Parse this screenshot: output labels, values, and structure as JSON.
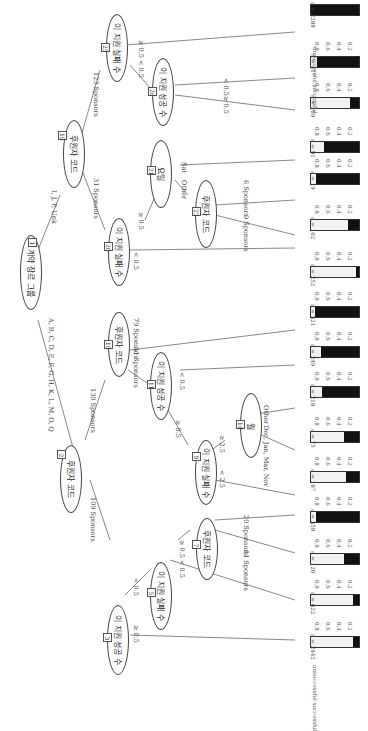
{
  "diagram": {
    "type": "decision-tree",
    "orientation": "rotated-90",
    "legend": {
      "labels": [
        "unsuccessful",
        "successful"
      ],
      "colors": {
        "successful": "#f2f2f2",
        "unsuccessful": "#111111"
      }
    },
    "axis_ticks": [
      "0.8",
      "0.6",
      "0.4",
      "0.2"
    ],
    "nodes": [
      {
        "id": "1",
        "label": "계약 장르 그룹"
      },
      {
        "id": "2",
        "label": "후원자 코드"
      },
      {
        "id": "3",
        "label": "이 지원 성공 수"
      },
      {
        "id": "5",
        "label": "이 지원 실패 수"
      },
      {
        "id": "7",
        "label": "후원자 코드"
      },
      {
        "id": "9",
        "label": "이 지원 실패 수"
      },
      {
        "id": "10",
        "label": "후원자 코드"
      },
      {
        "id": "11",
        "label": "이 지원 성공 수"
      },
      {
        "id": "14",
        "label": "월"
      },
      {
        "id": "19",
        "label": "후원자 코드"
      },
      {
        "id": "20",
        "label": "이 지원 실패 수"
      },
      {
        "id": "21",
        "label": "요일"
      },
      {
        "id": "23",
        "label": "후원자 코드"
      },
      {
        "id": "25",
        "label": "이 지원 실패 수"
      },
      {
        "id": "26",
        "label": "이 지원 성공 수"
      }
    ],
    "edges": {
      "e1_2": "A, B, C, D, E, F, G, H, K, L, M, O, Q",
      "e1_19": "I, J, P, Unk",
      "e2_3": "109 Sponsors",
      "e2_10": "130 Sponsors",
      "e3_leaf": "≥ 0.5",
      "e3_5": "< 0.5",
      "e5_leaf": "< 0.5",
      "e5_7": "≥ 0.5",
      "e7_l1": "11 Sponsors",
      "e7_l2": "20 Sponsors",
      "e10_11": "51 Sponsors",
      "e10_leaf": "79 Sponsors",
      "e11_9": "≥ 0.5",
      "e11_leaf": "< 0.5",
      "e9_leaf": "< 2.5",
      "e9_14": "≥ 2.5",
      "e14_l1": "Dec, Jan, Mar, Nov",
      "e14_l2": "Other",
      "e19_20": "31 Sponsors",
      "e19_25": "123 Sponsors",
      "e20_leaf": "< 0.5",
      "e20_21": "≥ 0.5",
      "e21_23": "Other",
      "e21_leaf": "Sat",
      "e23_l1": "9 Sponsors",
      "e23_l2": "6 Sponsors",
      "e25_26": "< 0.5",
      "e25_leaf": "≥ 0.5",
      "e26_l1": "≥ 0.5",
      "e26_l2": "< 0.5"
    },
    "leaves": [
      {
        "n": "n = 2288",
        "succ": 0.0
      },
      {
        "n": "n = 417",
        "succ": 0.12
      },
      {
        "n": "n = 169",
        "succ": 0.82
      },
      {
        "n": "n = 91",
        "succ": 0.28
      },
      {
        "n": "n = 19",
        "succ": 0.1
      },
      {
        "n": "n = 102",
        "succ": 0.77
      },
      {
        "n": "n = 252",
        "succ": 0.93
      },
      {
        "n": "n = 521",
        "succ": 0.09
      },
      {
        "n": "n = 249",
        "succ": 0.2
      },
      {
        "n": "n = 218",
        "succ": 0.22
      },
      {
        "n": "n = 75",
        "succ": 0.69
      },
      {
        "n": "n = 187",
        "succ": 0.73
      },
      {
        "n": "n = 358",
        "succ": 0.1
      },
      {
        "n": "n = 120",
        "succ": 0.68
      },
      {
        "n": "n = 622",
        "succ": 0.88
      },
      {
        "n": "n = 2442",
        "succ": 0.88
      }
    ]
  }
}
